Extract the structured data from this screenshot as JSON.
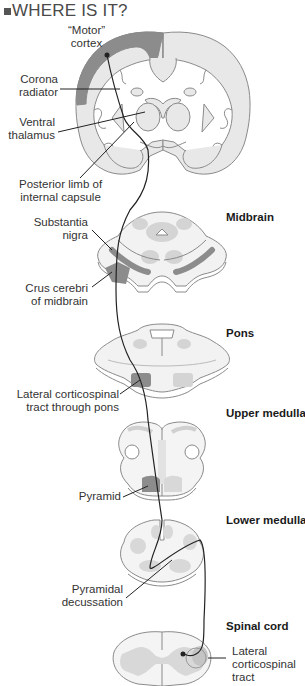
{
  "heading": {
    "bullet_icon": "square-bullet-icon",
    "title": "WHERE IS IT?"
  },
  "colors": {
    "tissue_light": "#e8e8e8",
    "tissue_outline": "#8a8a8a",
    "tract_dark": "#8c8c8c",
    "nuclei": "#cfcfcf",
    "pathway_line": "#222222",
    "heading_text": "#4a4a4a"
  },
  "sections": {
    "midbrain": "Midbrain",
    "pons": "Pons",
    "upper_medulla": "Upper medulla",
    "lower_medulla": "Lower medulla",
    "spinal_cord": "Spinal cord"
  },
  "labels": {
    "motor_cortex_1": "“Motor”",
    "motor_cortex_2": "cortex",
    "corona_1": "Corona",
    "corona_2": "radiator",
    "ventral_thalamus_1": "Ventral",
    "ventral_thalamus_2": "thalamus",
    "posterior_limb_1": "Posterior limb of",
    "posterior_limb_2": "internal capsule",
    "substantia_nigra_1": "Substantia",
    "substantia_nigra_2": "nigra",
    "crus_cerebri_1": "Crus cerebri",
    "crus_cerebri_2": "of midbrain",
    "lateral_cst_pons_1": "Lateral corticospinal",
    "lateral_cst_pons_2": "tract through pons",
    "pyramid": "Pyramid",
    "pyramidal_decussation_1": "Pyramidal",
    "pyramidal_decussation_2": "decussation",
    "lateral_cst_1": "Lateral",
    "lateral_cst_2": "corticospinal",
    "lateral_cst_3": "tract"
  }
}
